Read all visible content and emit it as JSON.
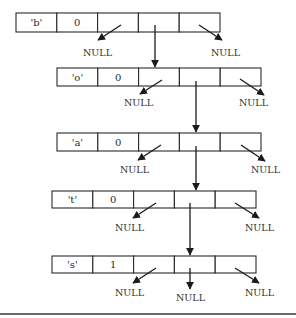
{
  "diagram": {
    "type": "trie-node-chain",
    "nodes": [
      {
        "char": "'b'",
        "count": "0",
        "x": 16,
        "y": 13,
        "cell_w": 40.8,
        "h": 19
      },
      {
        "char": "'o'",
        "count": "0",
        "x": 57,
        "y": 68,
        "cell_w": 40.8,
        "h": 18
      },
      {
        "char": "'a'",
        "count": "0",
        "x": 57,
        "y": 133,
        "cell_w": 40.8,
        "h": 18
      },
      {
        "char": "'t'",
        "count": "0",
        "x": 52,
        "y": 191,
        "cell_w": 40.8,
        "h": 17
      },
      {
        "char": "'s'",
        "count": "1",
        "x": 52,
        "y": 256,
        "cell_w": 40.8,
        "h": 17
      }
    ],
    "null_label": "NULL",
    "null_labels": [
      {
        "text": "NULL",
        "x": 83,
        "y": 56
      },
      {
        "text": "NULL",
        "x": 211,
        "y": 56
      },
      {
        "text": "NULL",
        "x": 124,
        "y": 106
      },
      {
        "text": "NULL",
        "x": 239,
        "y": 106
      },
      {
        "text": "NULL",
        "x": 120,
        "y": 173
      },
      {
        "text": "NULL",
        "x": 251,
        "y": 173
      },
      {
        "text": "NULL",
        "x": 115,
        "y": 231
      },
      {
        "text": "NULL",
        "x": 245,
        "y": 231
      },
      {
        "text": "NULL",
        "x": 115,
        "y": 296
      },
      {
        "text": "NULL",
        "x": 176,
        "y": 301
      },
      {
        "text": "NULL",
        "x": 245,
        "y": 296
      }
    ],
    "colors": {
      "stroke": "#1a1a1a",
      "text": "#2b2b2b",
      "background": "#ffffff",
      "rule": "#6a6a6a"
    }
  }
}
